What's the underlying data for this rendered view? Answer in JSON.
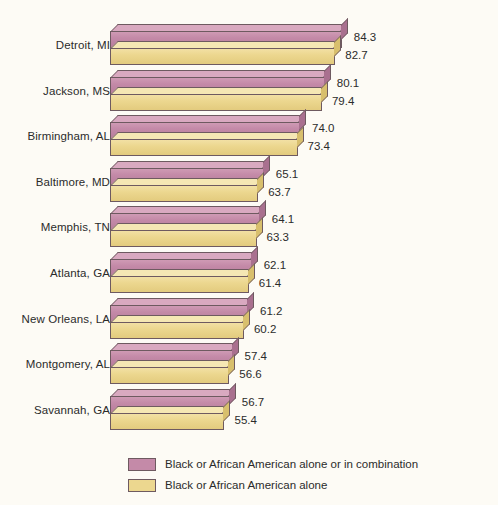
{
  "chart_data": {
    "type": "bar",
    "orientation": "horizontal",
    "title": "",
    "subtitle": "",
    "xlabel": "",
    "ylabel": "",
    "grid": false,
    "legend_position": "bottom",
    "value_format": "one-decimal percent",
    "axis_note": "truncated horizontal axis; bars do not start at zero",
    "xlim": [
      27.2,
      84.3
    ],
    "categories": [
      "Detroit, MI",
      "Jackson, MS",
      "Birmingham, AL",
      "Baltimore, MD",
      "Memphis, TN",
      "Atlanta, GA",
      "New Orleans, LA",
      "Montgomery, AL",
      "Savannah, GA"
    ],
    "series": [
      {
        "name": "Black or African American alone or in combination",
        "color": "#c48aa8",
        "values": [
          84.3,
          80.1,
          74.0,
          65.1,
          64.1,
          62.1,
          61.2,
          57.4,
          56.7
        ]
      },
      {
        "name": "Black or African American alone",
        "color": "#ecd78f",
        "values": [
          82.7,
          79.4,
          73.4,
          63.7,
          63.3,
          61.4,
          60.2,
          56.6,
          55.4
        ]
      }
    ]
  },
  "legend": {
    "items": [
      {
        "label": "Black or African American alone or in combination",
        "color": "#c48aa8"
      },
      {
        "label": "Black or African American alone",
        "color": "#ecd78f"
      }
    ]
  },
  "colors": {
    "background": "#fdfbf5",
    "series_combination": "#c48aa8",
    "series_alone": "#ecd78f",
    "outline": "#6e5a60",
    "text": "#2b2b2b"
  }
}
